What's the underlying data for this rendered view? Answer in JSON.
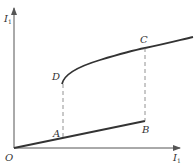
{
  "diagram": {
    "type": "hysteresis-curve",
    "axes": {
      "y_label": "I",
      "y_label_sub": "1",
      "x_label": "I",
      "x_label_sub": "1",
      "origin_label": "O"
    },
    "points": {
      "A": "A",
      "B": "B",
      "C": "C",
      "D": "D"
    },
    "colors": {
      "line": "#333333",
      "axis": "#555555",
      "dashed": "#777777"
    }
  }
}
